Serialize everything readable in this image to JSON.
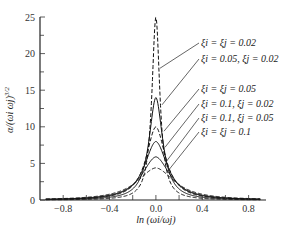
{
  "chart_data": {
    "type": "line",
    "title": "",
    "xlabel": "ln (ω_i/ω_j)",
    "ylabel": "α/(ω_i ω_j)^{3/2}",
    "xlim": [
      -1.0,
      0.95
    ],
    "ylim": [
      0,
      25
    ],
    "x_ticks": [
      -0.8,
      -0.4,
      0.0,
      0.4,
      0.8
    ],
    "x_tick_labels": [
      "−0.8",
      "−0.4",
      "0.0",
      "0.4",
      "0.8"
    ],
    "x_minor_step": 0.2,
    "y_ticks": [
      0,
      5,
      10,
      15,
      20,
      25
    ],
    "y_tick_labels": [
      "0",
      "5",
      "10",
      "15",
      "20",
      "25"
    ],
    "y_minor_step": 2.5,
    "grid": false,
    "legend_position": "right, annotated with leader lines",
    "series": [
      {
        "name": "ξ_i = ξ_j = 0.02",
        "style": "dashed",
        "peak": 25.0,
        "xi_i": 0.02,
        "xi_j": 0.02
      },
      {
        "name": "ξ_i = 0.05, ξ_j = 0.02",
        "style": "solid",
        "peak": 14.0,
        "xi_i": 0.05,
        "xi_j": 0.02
      },
      {
        "name": "ξ_i = ξ_j = 0.05",
        "style": "dashed",
        "peak": 10.0,
        "xi_i": 0.05,
        "xi_j": 0.05
      },
      {
        "name": "ξ_i = 0.1, ξ_j = 0.02",
        "style": "solid",
        "peak": 8.0,
        "xi_i": 0.1,
        "xi_j": 0.02
      },
      {
        "name": "ξ_i = 0.1, ξ_j = 0.05",
        "style": "solid",
        "peak": 5.9,
        "xi_i": 0.1,
        "xi_j": 0.05
      },
      {
        "name": "ξ_i = ξ_j = 0.1",
        "style": "dashed",
        "peak": 4.4,
        "xi_i": 0.1,
        "xi_j": 0.1
      }
    ]
  },
  "legend": {
    "labels": [
      "ξi = ξj = 0.02",
      "ξi = 0.05, ξj = 0.02",
      "ξi = ξj = 0.05",
      "ξi = 0.1, ξj = 0.02",
      "ξi = 0.1, ξj = 0.05",
      "ξi = ξj = 0.1"
    ]
  },
  "axes": {
    "xlabel": "ln (ωi/ωj)",
    "ylabel": "α/(ωi ωj)",
    "ylabel_exp": "3/2"
  }
}
